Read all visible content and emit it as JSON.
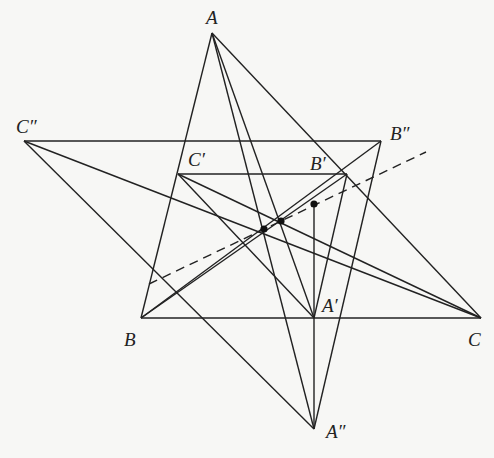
{
  "figure": {
    "colors": {
      "background": "#f7f7f5",
      "stroke": "#222222"
    },
    "points": {
      "A": {
        "label": "A",
        "x": 212,
        "y": 33,
        "lx": 206,
        "ly": 24
      },
      "B": {
        "label": "B",
        "x": 141,
        "y": 318,
        "lx": 124,
        "ly": 346
      },
      "C": {
        "label": "C",
        "x": 481,
        "y": 318,
        "lx": 468,
        "ly": 346
      },
      "A1": {
        "label": "A′",
        "x": 314,
        "y": 318,
        "lx": 322,
        "ly": 312
      },
      "B1": {
        "label": "B′",
        "x": 347,
        "y": 174,
        "lx": 310,
        "ly": 170
      },
      "C1": {
        "label": "C′",
        "x": 178,
        "y": 174,
        "lx": 188,
        "ly": 166
      },
      "A2": {
        "label": "A″",
        "x": 314,
        "y": 429,
        "lx": 326,
        "ly": 438
      },
      "B2": {
        "label": "B″",
        "x": 381,
        "y": 141,
        "lx": 390,
        "ly": 140
      },
      "C2": {
        "label": "C″",
        "x": 24,
        "y": 141,
        "lx": 16,
        "ly": 133
      }
    },
    "segments": [
      [
        "A",
        "B"
      ],
      [
        "B",
        "C"
      ],
      [
        "C",
        "A"
      ],
      [
        "C2",
        "B2"
      ],
      [
        "C1",
        "B1"
      ],
      [
        "A",
        "A1"
      ],
      [
        "A",
        "A2"
      ],
      [
        "B",
        "B1"
      ],
      [
        "B",
        "B2"
      ],
      [
        "C",
        "C1"
      ],
      [
        "C",
        "C2"
      ],
      [
        "C2",
        "A2"
      ],
      [
        "B2",
        "A2"
      ],
      [
        "C1",
        "A1"
      ],
      [
        "B1",
        "A1"
      ],
      [
        "A2",
        "A1"
      ]
    ],
    "extra_segments": [
      {
        "x1": 314,
        "y1": 204,
        "x2": 314,
        "y2": 318
      }
    ],
    "dashed_line": {
      "x1": 149,
      "y1": 284,
      "x2": 426,
      "y2": 152
    },
    "marked_points": [
      {
        "x": 264,
        "y": 229
      },
      {
        "x": 281,
        "y": 221
      },
      {
        "x": 314,
        "y": 204
      }
    ]
  }
}
